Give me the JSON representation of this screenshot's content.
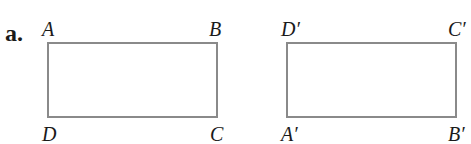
{
  "problem": {
    "part_label": "a.",
    "colors": {
      "outline": "#8a8a8a",
      "text": "#1a1a1a"
    },
    "figures": [
      {
        "name": "original",
        "vertices": {
          "top_left": "A",
          "top_right": "B",
          "bottom_left": "D",
          "bottom_right": "C"
        }
      },
      {
        "name": "image",
        "vertices": {
          "top_left": "D′",
          "top_right": "C′",
          "bottom_left": "A′",
          "bottom_right": "B′"
        }
      }
    ]
  }
}
